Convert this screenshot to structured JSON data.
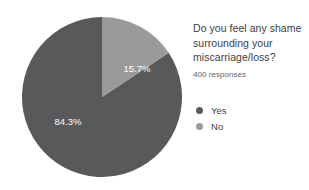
{
  "chart_data": {
    "type": "pie",
    "title": "Do you feel any shame surrounding your miscarriage/loss?",
    "title_lines": [
      "Do you feel any shame",
      "surrounding your",
      "miscarriage/loss?"
    ],
    "subtitle": "400 responses",
    "total_responses": 400,
    "xlabel": "",
    "ylabel": "",
    "grid": false,
    "legend_position": "right",
    "categories": [
      "Yes",
      "No"
    ],
    "values": [
      84.3,
      15.7
    ],
    "value_unit": "percent",
    "slices": [
      {
        "label": "Yes",
        "value": 84.3,
        "display": "84.3%",
        "color": "#58595b",
        "start_angle_deg": 56.52,
        "sweep_angle_deg": 303.48,
        "label_x": 68,
        "label_y": 122
      },
      {
        "label": "No",
        "value": 15.7,
        "display": "15.7%",
        "color": "#9a9a9a",
        "start_angle_deg": 0,
        "sweep_angle_deg": 56.52,
        "label_x": 137,
        "label_y": 69
      }
    ]
  },
  "colors": {
    "background": "#ffffff",
    "yes": "#58595b",
    "no": "#9a9a9a",
    "title_text": "#3c4043",
    "subtitle_text": "#5f6368",
    "slice_label_text": "#ffffff"
  },
  "legend": {
    "items": [
      {
        "label": "Yes",
        "color": "#58595b"
      },
      {
        "label": "No",
        "color": "#9a9a9a"
      }
    ]
  }
}
